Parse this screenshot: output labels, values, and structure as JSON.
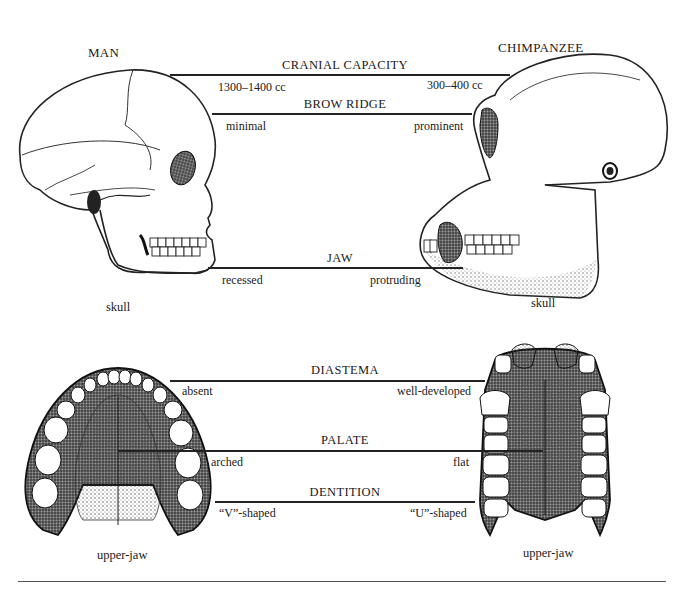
{
  "species": {
    "left": {
      "name": "MAN",
      "skull_caption": "skull",
      "jaw_caption": "upper-jaw"
    },
    "right": {
      "name": "CHIMPANZEE",
      "skull_caption": "skull",
      "jaw_caption": "upper-jaw"
    }
  },
  "comparisons": [
    {
      "feature": "CRANIAL CAPACITY",
      "man": "1300–1400 cc",
      "chimpanzee": "300–400 cc"
    },
    {
      "feature": "BROW RIDGE",
      "man": "minimal",
      "chimpanzee": "prominent"
    },
    {
      "feature": "JAW",
      "man": "recessed",
      "chimpanzee": "protruding"
    },
    {
      "feature": "DIASTEMA",
      "man": "absent",
      "chimpanzee": "well-developed"
    },
    {
      "feature": "PALATE",
      "man": "arched",
      "chimpanzee": "flat"
    },
    {
      "feature": "DENTITION",
      "man": "“V”-shaped",
      "chimpanzee": "“U”-shaped"
    }
  ],
  "colors": {
    "ink": "#1a1a1a",
    "background": "#ffffff",
    "stipple": "#555555"
  }
}
